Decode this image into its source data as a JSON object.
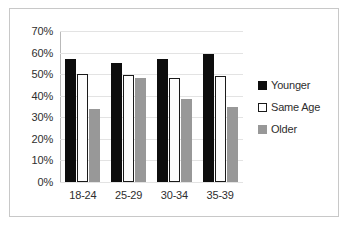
{
  "chart_data": {
    "type": "bar",
    "title": "",
    "subtitle": "",
    "xlabel": "",
    "ylabel": "",
    "categories": [
      "18-24",
      "25-29",
      "30-34",
      "35-39"
    ],
    "series": [
      {
        "name": "Younger",
        "color": "#0d0d0d",
        "swatch": "filled-black",
        "values": [
          57,
          55,
          57,
          59.5
        ]
      },
      {
        "name": "Same Age",
        "color": "#ffffff",
        "swatch": "outlined-white",
        "values": [
          50,
          49.5,
          48,
          49
        ]
      },
      {
        "name": "Older",
        "color": "#989898",
        "swatch": "filled-gray",
        "values": [
          34,
          48,
          38.5,
          35
        ]
      }
    ],
    "ylim": [
      0,
      70
    ],
    "ytick_step": 10,
    "ytick_labels": [
      "0%",
      "10%",
      "20%",
      "30%",
      "40%",
      "50%",
      "60%",
      "70%"
    ],
    "ytick_values": [
      0,
      10,
      20,
      30,
      40,
      50,
      60,
      70
    ],
    "value_suffix": "%",
    "grid": true,
    "legend_position": "right",
    "orientation": "vertical",
    "grouping": "clustered"
  }
}
